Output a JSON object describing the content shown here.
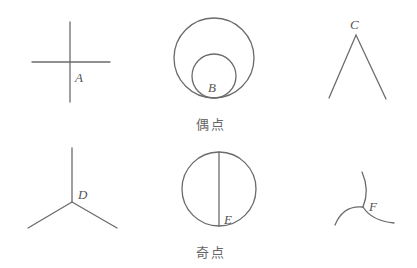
{
  "figure": {
    "colors": {
      "line": "#6b6b6b",
      "label": "#555555",
      "background": "#ffffff"
    },
    "groups": [
      {
        "label": "偶点",
        "points": [
          "A",
          "B",
          "C"
        ]
      },
      {
        "label": "奇点",
        "points": [
          "D",
          "E",
          "F"
        ]
      }
    ],
    "points": {
      "A": {
        "label": "A",
        "description": "two crossing straight lines, degree 4"
      },
      "B": {
        "label": "B",
        "description": "two internally tangent circles, degree 4"
      },
      "C": {
        "label": "C",
        "description": "apex of an angle, degree 2"
      },
      "D": {
        "label": "D",
        "description": "three line segments meeting, degree 3"
      },
      "E": {
        "label": "E",
        "description": "circle with vertical diameter endpoint, degree 3"
      },
      "F": {
        "label": "F",
        "description": "three curves meeting, degree 3"
      }
    }
  }
}
